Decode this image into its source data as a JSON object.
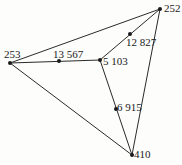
{
  "diagram": {
    "type": "graph",
    "colors": {
      "background": "#fdfdfb",
      "edge": "#2a2a2a",
      "node": "#1a1a1a"
    },
    "nodes": [
      {
        "id": "n252",
        "label": "252",
        "x": 160,
        "y": 9,
        "label_x": 165,
        "label_y": 12
      },
      {
        "id": "n253",
        "label": "253",
        "x": 10,
        "y": 63,
        "label_x": 5,
        "label_y": 57
      },
      {
        "id": "n5103",
        "label": "5 103",
        "x": 100,
        "y": 60,
        "label_x": 104,
        "label_y": 64
      },
      {
        "id": "n13567",
        "label": "13 567",
        "x": 59,
        "y": 61,
        "label_x": 54,
        "label_y": 57
      },
      {
        "id": "n12827",
        "label": "12 827",
        "x": 130,
        "y": 34,
        "label_x": 126,
        "label_y": 45
      },
      {
        "id": "n6915",
        "label": "6 915",
        "x": 116,
        "y": 109,
        "label_x": 117,
        "label_y": 109
      },
      {
        "id": "n410",
        "label": "410",
        "x": 132,
        "y": 155,
        "label_x": 134,
        "label_y": 157
      }
    ],
    "edges": [
      {
        "from": "n253",
        "to": "n252"
      },
      {
        "from": "n253",
        "to": "n410"
      },
      {
        "from": "n252",
        "to": "n410"
      },
      {
        "from": "n253",
        "to": "n5103"
      },
      {
        "from": "n5103",
        "to": "n252"
      },
      {
        "from": "n5103",
        "to": "n410"
      }
    ]
  }
}
